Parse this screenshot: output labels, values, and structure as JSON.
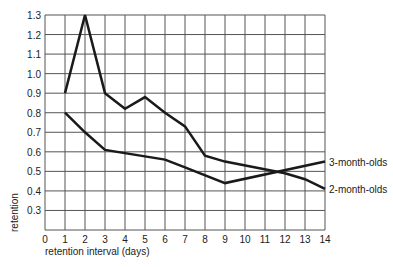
{
  "chart_data": {
    "type": "line",
    "title": "",
    "xlabel": "retention interval (days)",
    "ylabel": "retention",
    "xlim": [
      0,
      14
    ],
    "ylim": [
      0.2,
      1.3
    ],
    "grid": true,
    "x_ticks": [
      0,
      1,
      2,
      3,
      4,
      5,
      6,
      7,
      8,
      9,
      10,
      11,
      12,
      13,
      14
    ],
    "y_ticks": [
      0.3,
      0.4,
      0.5,
      0.6,
      0.7,
      0.8,
      0.9,
      1.0,
      1.1,
      1.2,
      1.3
    ],
    "y_tick_labels": [
      "0.3",
      "0.4",
      "0.5",
      "0.6",
      "0.7",
      "0.8",
      "0.9",
      "1.0",
      "1.1",
      "1.2",
      "1.3"
    ],
    "legend_position": "right-inline",
    "series": [
      {
        "name": "2-month-olds",
        "x": [
          1,
          2,
          3,
          4,
          5,
          6,
          7,
          8,
          9,
          12,
          13,
          14
        ],
        "values": [
          0.9,
          1.3,
          0.9,
          0.82,
          0.88,
          0.8,
          0.73,
          0.58,
          0.55,
          0.49,
          0.46,
          0.41
        ]
      },
      {
        "name": "3-month-olds",
        "x": [
          1,
          2,
          3,
          6,
          7,
          9,
          14
        ],
        "values": [
          0.8,
          0.7,
          0.61,
          0.56,
          0.52,
          0.44,
          0.55
        ]
      }
    ]
  }
}
